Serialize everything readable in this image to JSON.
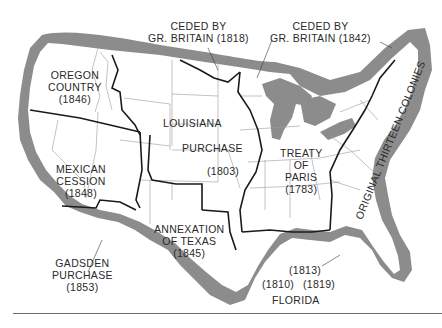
{
  "map": {
    "title": "Territorial Expansion of the United States",
    "colors": {
      "coast_band": "#8c8c8c",
      "land": "#ffffff",
      "territory_border": "#1a1a1a",
      "state_line": "#9a9a9a",
      "text": "#2a2a2a",
      "rule": "#6a6a6a"
    },
    "regions": [
      {
        "id": "oregon",
        "lines": [
          "OREGON",
          "COUNTRY",
          "(1846)"
        ]
      },
      {
        "id": "mexican",
        "lines": [
          "MEXICAN",
          "CESSION",
          "(1848)"
        ]
      },
      {
        "id": "gadsden",
        "lines": [
          "GADSDEN",
          "PURCHASE",
          "(1853)"
        ]
      },
      {
        "id": "louisiana",
        "lines": [
          "LOUISIANA",
          "PURCHASE",
          "(1803)"
        ]
      },
      {
        "id": "texas",
        "lines": [
          "ANNEXATION",
          "OF TEXAS",
          "(1845)"
        ]
      },
      {
        "id": "paris",
        "lines": [
          "TREATY",
          "OF",
          "PARIS",
          "(1783)"
        ]
      },
      {
        "id": "britain1818",
        "lines": [
          "CEDED BY",
          "GR. BRITAIN (1818)"
        ]
      },
      {
        "id": "britain1842",
        "lines": [
          "CEDED BY",
          "GR. BRITAIN (1842)"
        ]
      },
      {
        "id": "colonies",
        "lines": [
          "ORIGINAL THIRTEEN COLONIES"
        ]
      },
      {
        "id": "florida",
        "lines": [
          "FLORIDA"
        ]
      },
      {
        "id": "fl1810",
        "lines": [
          "(1810)"
        ]
      },
      {
        "id": "fl1813",
        "lines": [
          "(1813)"
        ]
      },
      {
        "id": "fl1819",
        "lines": [
          "(1819)"
        ]
      }
    ]
  }
}
